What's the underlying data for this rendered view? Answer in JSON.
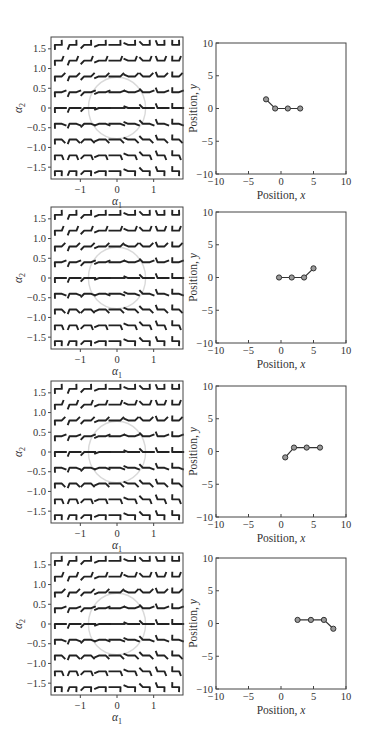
{
  "chart_data": [
    {
      "type": "glyph-field",
      "panel": "shape-space-left",
      "title": "",
      "xlabel": "α1",
      "ylabel": "α2",
      "xlim": [
        -1.8,
        1.8
      ],
      "ylim": [
        -1.8,
        1.8
      ],
      "xticks": [
        "-1",
        "0",
        "1"
      ],
      "xtick_values": [
        -1,
        0,
        1
      ],
      "yticks": [
        "1.5",
        "1.0",
        "0.5",
        "0",
        "-0.5",
        "-1.0",
        "-1.5"
      ],
      "ytick_values": [
        1.5,
        1.0,
        0.5,
        0,
        -0.5,
        -1.0,
        -1.5
      ],
      "grid_values": [
        -1.6,
        -1.2,
        -0.8,
        -0.4,
        0,
        0.4,
        0.8,
        1.2,
        1.6
      ],
      "glyph": "three-link swimmer shape at (α1, α2)",
      "circle": {
        "center": [
          0,
          0
        ],
        "radius": 0.78,
        "color": "#d9d9d9"
      },
      "repeated_in_rows": 4
    },
    {
      "type": "line",
      "panel": "row-1-position",
      "xlabel": "Position, x",
      "ylabel": "Position, y",
      "xlim": [
        -10,
        10
      ],
      "ylim": [
        -10,
        10
      ],
      "xticks": [
        "-10",
        "-5",
        "0",
        "5",
        "10"
      ],
      "yticks": [
        "10",
        "5",
        "0",
        "-5",
        "-10"
      ],
      "x": [
        -2.3,
        -0.9,
        1.05,
        2.95
      ],
      "y": [
        1.4,
        0,
        0,
        0
      ]
    },
    {
      "type": "line",
      "panel": "row-2-position",
      "xlabel": "Position, x",
      "ylabel": "Position, y",
      "xlim": [
        -10,
        10
      ],
      "ylim": [
        -10,
        10
      ],
      "xticks": [
        "-10",
        "-5",
        "0",
        "5",
        "10"
      ],
      "yticks": [
        "10",
        "5",
        "0",
        "-5",
        "-10"
      ],
      "x": [
        -0.3,
        1.65,
        3.55,
        5.0
      ],
      "y": [
        0,
        0,
        0,
        1.4
      ]
    },
    {
      "type": "line",
      "panel": "row-3-position",
      "xlabel": "Position, x",
      "ylabel": "Position, y",
      "xlim": [
        -10,
        10
      ],
      "ylim": [
        -10,
        10
      ],
      "xticks": [
        "-10",
        "-5",
        "0",
        "5",
        "10"
      ],
      "yticks": [
        "10",
        "5",
        "0",
        "-5",
        "-10"
      ],
      "x": [
        0.65,
        2.0,
        3.95,
        6.0
      ],
      "y": [
        -0.9,
        0.6,
        0.6,
        0.6
      ]
    },
    {
      "type": "line",
      "panel": "row-4-position",
      "xlabel": "Position, x",
      "ylabel": "Position, y",
      "xlim": [
        -10,
        10
      ],
      "ylim": [
        -10,
        10
      ],
      "xticks": [
        "-10",
        "-5",
        "0",
        "5",
        "10"
      ],
      "yticks": [
        "10",
        "5",
        "0",
        "-5",
        "-10"
      ],
      "x": [
        2.55,
        4.6,
        6.6,
        8.05
      ],
      "y": [
        0.55,
        0.55,
        0.55,
        -0.8
      ]
    }
  ],
  "labels": {
    "alpha1": "α",
    "alpha1_sub": "1",
    "alpha2": "α",
    "alpha2_sub": "2",
    "pos_x": "Position, ",
    "pos_x_var": "x",
    "pos_y": "Position, ",
    "pos_y_var": "y"
  },
  "colors": {
    "frame": "#444444",
    "glyph": "#222222",
    "circle": "#d9d9d9",
    "marker_fill": "#9a9a9a",
    "marker_edge": "#333333",
    "line": "#333333"
  },
  "rows": [
    {
      "left_top": 37,
      "right_top": 43
    },
    {
      "left_top": 207,
      "right_top": 212
    },
    {
      "left_top": 381,
      "right_top": 386
    },
    {
      "left_top": 553,
      "right_top": 558
    }
  ]
}
